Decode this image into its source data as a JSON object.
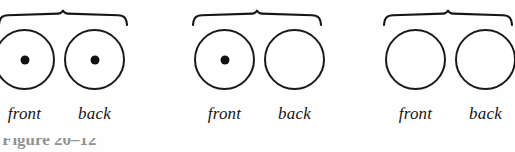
{
  "figure": {
    "caption_partial": "Figure 20–12",
    "label_front": "front",
    "label_back": "back",
    "stroke_color": "#1a1a1a",
    "pip_color": "#131313",
    "background_color": "#fefefe",
    "groups": [
      {
        "name": "group-1-both-marked",
        "brace_label": "",
        "coins": [
          {
            "side": "front",
            "marked": true
          },
          {
            "side": "back",
            "marked": true
          }
        ]
      },
      {
        "name": "group-2-front-marked",
        "brace_label": "",
        "coins": [
          {
            "side": "front",
            "marked": true
          },
          {
            "side": "back",
            "marked": false
          }
        ]
      },
      {
        "name": "group-3-none-marked",
        "brace_label": "",
        "coins": [
          {
            "side": "front",
            "marked": false
          },
          {
            "side": "back",
            "marked": false
          }
        ]
      }
    ]
  }
}
